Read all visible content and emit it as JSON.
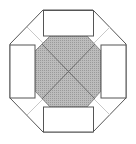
{
  "diagram": {
    "colors": {
      "background": "#ffffff",
      "outline": "#555555",
      "inner_fill": "#b4b4b4",
      "inner_dots": "#9a9a9a",
      "diagonal_lines": "#6e6e6e",
      "light_lines": "#c8c8c8",
      "rect_fill": "#ffffff"
    },
    "outer_octagon": "43,10 93,10 126,44 126,98 93,132 43,132 10,98 10,44",
    "inner_octagon": "50,36 87,36 101,51 101,91 87,107 50,107 35,91 35,51",
    "rectangles": [
      {
        "name": "top",
        "x": 43,
        "y": 10,
        "w": 51,
        "h": 26
      },
      {
        "name": "right",
        "x": 101,
        "y": 45,
        "w": 25,
        "h": 53
      },
      {
        "name": "bottom",
        "x": 43,
        "y": 107,
        "w": 51,
        "h": 25
      },
      {
        "name": "left",
        "x": 10,
        "y": 45,
        "w": 25,
        "h": 53
      }
    ],
    "center": {
      "x": 68,
      "y": 71
    }
  }
}
